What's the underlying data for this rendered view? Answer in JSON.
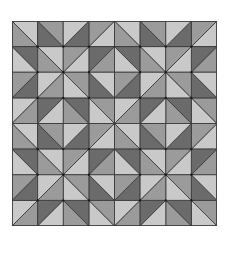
{
  "figure": {
    "repeat": [
      2,
      2
    ],
    "block_units": 4,
    "colors": {
      "light": "#c9c9c9",
      "mid": "#9b9b9b",
      "dark": "#6b6b6b",
      "line": "#3a3a3a"
    }
  },
  "quadrant_triangles": [
    {
      "pts": [
        [
          0,
          0
        ],
        [
          1,
          0
        ],
        [
          1,
          1
        ]
      ],
      "shade": "light"
    },
    {
      "pts": [
        [
          0,
          0
        ],
        [
          0,
          1
        ],
        [
          1,
          1
        ]
      ],
      "shade": "mid"
    },
    {
      "pts": [
        [
          1,
          0
        ],
        [
          1,
          1
        ],
        [
          2,
          1
        ]
      ],
      "shade": "dark"
    },
    {
      "pts": [
        [
          1,
          0
        ],
        [
          2,
          0
        ],
        [
          2,
          1
        ]
      ],
      "shade": "mid"
    },
    {
      "pts": [
        [
          0,
          1
        ],
        [
          1,
          1
        ],
        [
          1,
          2
        ]
      ],
      "shade": "dark"
    },
    {
      "pts": [
        [
          0,
          1
        ],
        [
          0,
          2
        ],
        [
          1,
          2
        ]
      ],
      "shade": "light"
    },
    {
      "pts": [
        [
          1,
          1
        ],
        [
          2,
          1
        ],
        [
          2,
          2
        ]
      ],
      "shade": "light"
    },
    {
      "pts": [
        [
          1,
          1
        ],
        [
          1,
          2
        ],
        [
          2,
          2
        ]
      ],
      "shade": "mid"
    }
  ]
}
